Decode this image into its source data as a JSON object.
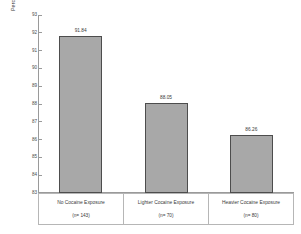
{
  "chart_data": {
    "type": "bar",
    "title": "",
    "subtitle": "",
    "xlabel": "",
    "ylabel": "Perceptual Reasoning IQ",
    "ylim": [
      83,
      93
    ],
    "ytick_labels": [
      "93",
      "92",
      "91",
      "90",
      "89",
      "88",
      "87",
      "86",
      "85",
      "84",
      "83"
    ],
    "ytick_values": [
      93,
      92,
      91,
      90,
      89,
      88,
      87,
      86,
      85,
      84,
      83
    ],
    "grid": false,
    "legend": null,
    "categories": [
      "No Cocaine Exposure",
      "Lighter Cocaine Exposure",
      "Heavier Cocaine Exposure"
    ],
    "values": [
      91.84,
      88.05,
      86.26
    ],
    "value_labels": [
      "91.84",
      "88.05",
      "86.26"
    ],
    "group_sizes": [
      "(n= 143)",
      "(n= 70)",
      "(n= 80)"
    ],
    "bar_fill_color": "#a8a8a8",
    "bar_border_color": "#4d4d4d",
    "axis_color": "#9a9a9a",
    "background_color": "#ffffff"
  }
}
